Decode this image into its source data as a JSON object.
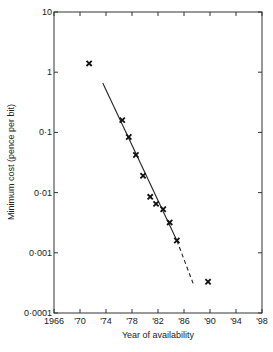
{
  "chart_data": {
    "type": "scatter",
    "title": "",
    "xlabel": "Year of availability",
    "ylabel": "Minimum cost (pence per bit)",
    "xlim": [
      1966,
      1998
    ],
    "ylim": [
      0.0001,
      10
    ],
    "yscale": "log",
    "grid": false,
    "x_ticks": [
      1966,
      1970,
      1974,
      1978,
      1982,
      1986,
      1990,
      1994,
      1998
    ],
    "x_tick_labels": [
      "1966",
      "'70",
      "'74",
      "'78",
      "'82",
      "'86",
      "'90",
      "'94",
      "'98"
    ],
    "y_ticks": [
      10,
      1,
      0.1,
      0.01,
      0.001,
      0.0001
    ],
    "y_tick_labels": [
      "10",
      "1",
      "0·1",
      "0·01",
      "0·001",
      "0·0001"
    ],
    "series": [
      {
        "name": "Data points",
        "marker": "x",
        "x": [
          1971.4,
          1976.5,
          1977.5,
          1978.6,
          1979.7,
          1980.8,
          1981.7,
          1982.8,
          1983.8,
          1984.9,
          1989.7
        ],
        "y": [
          1.4,
          0.16,
          0.084,
          0.042,
          0.019,
          0.0085,
          0.0065,
          0.0053,
          0.0032,
          0.0016,
          0.00033
        ]
      },
      {
        "name": "Trend line (solid)",
        "style": "solid",
        "x": [
          1973.5,
          1984.9
        ],
        "y": [
          0.66,
          0.0016
        ]
      },
      {
        "name": "Trend line (extrapolated)",
        "style": "dashed",
        "x": [
          1984.9,
          1987.4
        ],
        "y": [
          0.0016,
          0.00031
        ]
      }
    ],
    "legend": null
  }
}
